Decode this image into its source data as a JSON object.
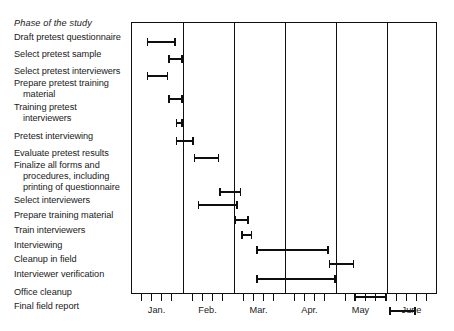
{
  "header": {
    "phase_column_title": "Phase of the study"
  },
  "chart_data": {
    "type": "bar",
    "chart_subtype": "gantt",
    "title": "",
    "xlabel": "",
    "ylabel": "Phase of the study",
    "grid": true,
    "legend": "none",
    "x_unit": "month",
    "x_axis": {
      "months": [
        "Jan.",
        "Feb.",
        "Mar.",
        "Apr.",
        "May",
        "June"
      ],
      "month_start_values": [
        0,
        1,
        2,
        3,
        4,
        5
      ],
      "xlim": [
        0,
        6
      ],
      "minor_ticks_per_month": 4,
      "tick_labels": [
        "Jan.",
        "Feb.",
        "Mar.",
        "Apr.",
        "May",
        "June"
      ]
    },
    "categories": [
      "Draft pretest questionnaire",
      "Select pretest sample",
      "Select pretest interviewers",
      "Prepare pretest training material",
      "Training pretest interviewers",
      "Pretest interviewing",
      "Evaluate pretest results",
      "Finalize all forms and procedures, including printing of questionnaire",
      "Select interviewers",
      "Prepare training material",
      "Train interviewers",
      "Interviewing",
      "Cleanup in field",
      "Interviewer verification",
      "Office cleanup",
      "Final field report"
    ],
    "tasks": [
      {
        "label_lines": [
          "Draft pretest questionnaire"
        ],
        "start": 0.29,
        "end": 0.86,
        "label_y": 40,
        "bar_y": 40
      },
      {
        "label_lines": [
          "Select pretest sample"
        ],
        "start": 0.71,
        "end": 1.0,
        "label_y": 57,
        "bar_y": 57
      },
      {
        "label_lines": [
          "Select pretest interviewers"
        ],
        "start": 0.29,
        "end": 0.71,
        "label_y": 74,
        "bar_y": 74
      },
      {
        "label_lines": [
          "Prepare pretest training",
          "material"
        ],
        "start": 0.71,
        "end": 1.0,
        "label_y": 86,
        "bar_y": 97
      },
      {
        "label_lines": [
          "Training pretest",
          "interviewers"
        ],
        "start": 0.86,
        "end": 1.0,
        "label_y": 110,
        "bar_y": 121
      },
      {
        "label_lines": [
          "Pretest interviewing"
        ],
        "start": 0.86,
        "end": 1.21,
        "label_y": 139,
        "bar_y": 139
      },
      {
        "label_lines": [
          "Evaluate pretest results"
        ],
        "start": 1.21,
        "end": 1.71,
        "label_y": 156,
        "bar_y": 156
      },
      {
        "label_lines": [
          "Finalize all forms and",
          "procedures, including",
          "printing of questionnaire"
        ],
        "start": 1.71,
        "end": 2.14,
        "label_y": 168,
        "bar_y": 190
      },
      {
        "label_lines": [
          "Select interviewers"
        ],
        "start": 1.29,
        "end": 2.07,
        "label_y": 203,
        "bar_y": 203
      },
      {
        "label_lines": [
          "Prepare training material"
        ],
        "start": 2.0,
        "end": 2.29,
        "label_y": 218,
        "bar_y": 218
      },
      {
        "label_lines": [
          "Train interviewers"
        ],
        "start": 2.14,
        "end": 2.36,
        "label_y": 233,
        "bar_y": 233
      },
      {
        "label_lines": [
          "Interviewing"
        ],
        "start": 2.43,
        "end": 3.86,
        "label_y": 248,
        "bar_y": 248
      },
      {
        "label_lines": [
          "Cleanup in field"
        ],
        "start": 3.86,
        "end": 4.36,
        "label_y": 262,
        "bar_y": 262
      },
      {
        "label_lines": [
          "Interviewer verification"
        ],
        "start": 2.43,
        "end": 4.0,
        "label_y": 277,
        "bar_y": 277
      },
      {
        "label_lines": [
          "Office cleanup"
        ],
        "start": 4.36,
        "end": 5.0,
        "label_y": 295,
        "bar_y": 295
      },
      {
        "label_lines": [
          "Final field report"
        ],
        "start": 5.04,
        "end": 5.57,
        "label_y": 309,
        "bar_y": 309
      }
    ]
  },
  "colors": {
    "ink": "#0f0f0f",
    "background": "#ffffff",
    "bar": "#0f0f0f"
  }
}
